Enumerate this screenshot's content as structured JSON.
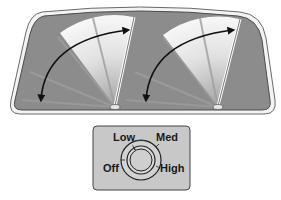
{
  "diagram": {
    "windshield": {
      "glass_color": "#8c8c8c",
      "frame_color": "#f2f2f2",
      "outline_color": "#555555"
    },
    "wipers": [
      {
        "name": "left-wiper",
        "sweep": "double-headed arrow"
      },
      {
        "name": "right-wiper",
        "sweep": "double-headed arrow"
      }
    ],
    "control": {
      "panel_color": "#c8c8c8",
      "labels": {
        "low": "Low",
        "med": "Med",
        "off": "Off",
        "high": "High"
      },
      "selected": "Low"
    }
  }
}
